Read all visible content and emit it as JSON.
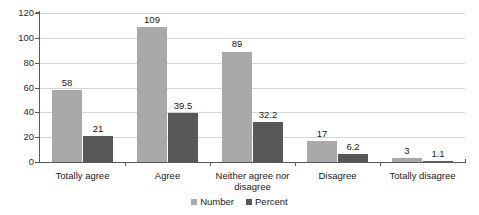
{
  "chart_data": {
    "type": "bar",
    "title": "",
    "subtitle": "",
    "xlabel": "",
    "ylabel": "",
    "ylim": [
      0,
      120
    ],
    "yticks": [
      0,
      20,
      40,
      60,
      80,
      100,
      120
    ],
    "grid": true,
    "legend_position": "bottom-center",
    "categories": [
      "Totally agree",
      "Agree",
      "Neither agree nor disagree",
      "Disagree",
      "Totally disagree"
    ],
    "series": [
      {
        "name": "Number",
        "color": "#a9a9a9",
        "values": [
          58,
          109,
          89,
          17,
          3
        ],
        "labels": [
          "58",
          "109",
          "89",
          "17",
          "3"
        ]
      },
      {
        "name": "Percent",
        "color": "#585858",
        "values": [
          21,
          39.5,
          32.2,
          6.2,
          1.1
        ],
        "labels": [
          "21",
          "39.5",
          "32.2",
          "6.2",
          "1.1"
        ]
      }
    ]
  },
  "axis": {
    "y_tick_labels": [
      "0",
      "20",
      "40",
      "60",
      "80",
      "100",
      "120"
    ]
  }
}
